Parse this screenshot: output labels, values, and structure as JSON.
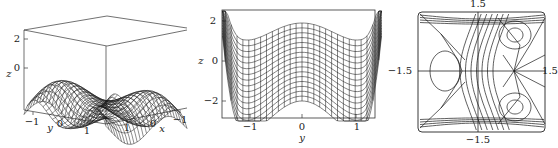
{
  "chart_data": [
    {
      "type": "surface3d",
      "title": "",
      "xlabel": "x",
      "ylabel": "y",
      "zlabel": "z",
      "x_ticks": [
        "1",
        "0",
        "−1"
      ],
      "y_ticks": [
        "−1",
        "0",
        "1"
      ],
      "z_ticks": [
        "2",
        "0"
      ],
      "xlim": [
        -1.5,
        1.5
      ],
      "ylim": [
        -1.5,
        1.5
      ],
      "zlim": [
        -3,
        2.5
      ],
      "description": "Wireframe mesh surface with wave-like ridges in a 3D box"
    },
    {
      "type": "line",
      "title": "",
      "xlabel": "y",
      "ylabel": "z",
      "x_ticks": [
        "−1",
        "0",
        "1"
      ],
      "y_ticks": [
        "2",
        "0",
        "−2"
      ],
      "xlim": [
        -1.5,
        1.5
      ],
      "ylim": [
        -3,
        2.5
      ],
      "series_shape": "double-well: max at y=0, minima near y=±1, rising steeply at edges",
      "top_curve": {
        "y": [
          -1.5,
          -1,
          0,
          1,
          1.5
        ],
        "z": [
          2.4,
          1.0,
          1.9,
          1.0,
          2.4
        ]
      },
      "bottom_curve": {
        "y": [
          -1.5,
          -1,
          0,
          1,
          1.5
        ],
        "z": [
          0.2,
          -3.0,
          -2.0,
          -3.0,
          0.2
        ]
      },
      "description": "Side projection of the wireframe surface viewed along x"
    },
    {
      "type": "contour",
      "title": "",
      "left_label": "−1.5",
      "right_label": "1.5",
      "top_label": "1.5",
      "bottom_label": "−1.5",
      "xlim": [
        -1.5,
        1.5
      ],
      "ylim": [
        -1.5,
        1.5
      ],
      "description": "Contour/phase portrait: closed orbits around centers at left-middle and right top/bottom, saddle (X) points at left top/bottom and right middle, wavy separating curves"
    }
  ],
  "plot1": {
    "z_tick_2": "2",
    "z_tick_0": "0",
    "z_label": "z",
    "y_tick_m1": "−1",
    "y_label": "y",
    "y_tick_0": "0",
    "y_tick_1": "1",
    "x_tick_1": "1",
    "x_tick_0": "0",
    "x_label": "x",
    "x_tick_m1": "−1"
  },
  "plot2": {
    "z_tick_2": "2",
    "z_tick_0": "0",
    "z_tick_m2": "−2",
    "z_label": "z",
    "y_tick_m1": "−1",
    "y_tick_0": "0",
    "y_tick_1": "1",
    "y_label": "y"
  },
  "plot3": {
    "top": "1.5",
    "left": "−1.5",
    "right": "1.5",
    "bottom": "−1.5"
  },
  "colors": {
    "line": "#222222",
    "background": "#ffffff"
  }
}
